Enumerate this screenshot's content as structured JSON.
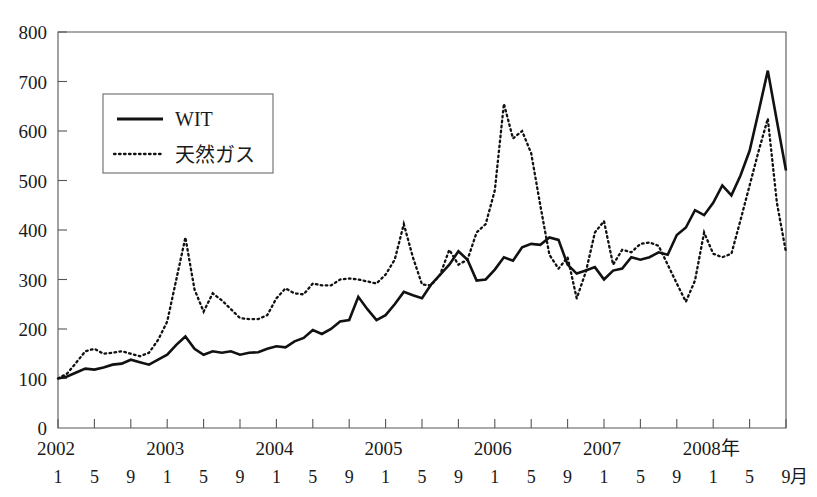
{
  "figure": {
    "top_caption_fragment": "",
    "axis_color": "#55565a",
    "line_color": "#111111"
  },
  "legend": {
    "entries": [
      {
        "label": "WIT",
        "style": "solid"
      },
      {
        "label": "天然ガス",
        "style": "dotted"
      }
    ]
  },
  "axes": {
    "y_ticks": [
      "0",
      "100",
      "200",
      "300",
      "400",
      "500",
      "600",
      "700",
      "800"
    ],
    "year_labels": [
      "2002",
      "2003",
      "2004",
      "2005",
      "2006",
      "2007",
      "2008年"
    ],
    "month_labels": [
      "1",
      "5",
      "9",
      "1",
      "5",
      "9",
      "1",
      "5",
      "9",
      "1",
      "5",
      "9",
      "1",
      "5",
      "9",
      "1",
      "5",
      "9",
      "1",
      "5",
      "9"
    ],
    "month_unit_label": "月"
  },
  "chart_data": {
    "type": "line",
    "title": "",
    "xlabel": "年 / 月",
    "ylabel": "",
    "ylim": [
      0,
      800
    ],
    "ytick_step": 100,
    "grid": false,
    "legend_position": "upper-left-inset",
    "x_start": "2002-01",
    "x_end": "2008-09",
    "x_frequency": "monthly",
    "x": [
      "2002-01",
      "2002-02",
      "2002-03",
      "2002-04",
      "2002-05",
      "2002-06",
      "2002-07",
      "2002-08",
      "2002-09",
      "2002-10",
      "2002-11",
      "2002-12",
      "2003-01",
      "2003-02",
      "2003-03",
      "2003-04",
      "2003-05",
      "2003-06",
      "2003-07",
      "2003-08",
      "2003-09",
      "2003-10",
      "2003-11",
      "2003-12",
      "2004-01",
      "2004-02",
      "2004-03",
      "2004-04",
      "2004-05",
      "2004-06",
      "2004-07",
      "2004-08",
      "2004-09",
      "2004-10",
      "2004-11",
      "2004-12",
      "2005-01",
      "2005-02",
      "2005-03",
      "2005-04",
      "2005-05",
      "2005-06",
      "2005-07",
      "2005-08",
      "2005-09",
      "2005-10",
      "2005-11",
      "2005-12",
      "2006-01",
      "2006-02",
      "2006-03",
      "2006-04",
      "2006-05",
      "2006-06",
      "2006-07",
      "2006-08",
      "2006-09",
      "2006-10",
      "2006-11",
      "2006-12",
      "2007-01",
      "2007-02",
      "2007-03",
      "2007-04",
      "2007-05",
      "2007-06",
      "2007-07",
      "2007-08",
      "2007-09",
      "2007-10",
      "2007-11",
      "2007-12",
      "2008-01",
      "2008-02",
      "2008-03",
      "2008-04",
      "2008-05",
      "2008-06",
      "2008-07",
      "2008-08",
      "2008-09"
    ],
    "series": [
      {
        "name": "WIT",
        "style": "solid",
        "values": [
          100,
          104,
          112,
          120,
          118,
          122,
          128,
          130,
          138,
          133,
          128,
          138,
          148,
          168,
          185,
          160,
          148,
          155,
          152,
          155,
          148,
          152,
          153,
          160,
          165,
          163,
          175,
          182,
          198,
          190,
          200,
          215,
          218,
          265,
          240,
          218,
          228,
          250,
          275,
          268,
          262,
          290,
          310,
          330,
          357,
          340,
          298,
          300,
          320,
          345,
          338,
          365,
          372,
          370,
          385,
          380,
          330,
          312,
          318,
          325,
          300,
          318,
          322,
          345,
          340,
          345,
          355,
          350,
          390,
          405,
          440,
          430,
          455,
          490,
          470,
          510,
          560,
          640,
          722,
          620,
          520
        ]
      },
      {
        "name": "天然ガス",
        "style": "dotted",
        "values": [
          100,
          110,
          132,
          155,
          160,
          150,
          152,
          155,
          150,
          145,
          152,
          178,
          215,
          300,
          385,
          280,
          235,
          272,
          258,
          240,
          222,
          220,
          220,
          228,
          262,
          282,
          272,
          270,
          292,
          288,
          288,
          300,
          302,
          300,
          296,
          292,
          310,
          340,
          412,
          345,
          290,
          288,
          310,
          360,
          330,
          340,
          395,
          412,
          480,
          655,
          585,
          600,
          555,
          450,
          350,
          322,
          345,
          262,
          315,
          395,
          418,
          330,
          360,
          355,
          372,
          375,
          368,
          330,
          292,
          255,
          298,
          395,
          352,
          345,
          352,
          420,
          490,
          560,
          625,
          455,
          355
        ]
      }
    ]
  }
}
